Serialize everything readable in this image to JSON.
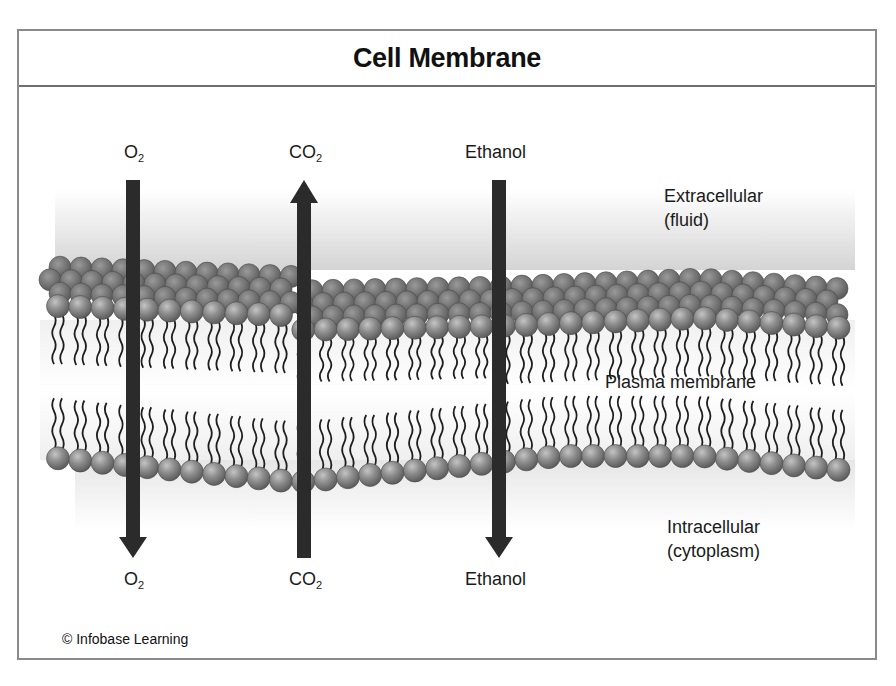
{
  "title": "Cell Membrane",
  "regions": {
    "extracellular": {
      "line1": "Extracellular",
      "line2": "(fluid)"
    },
    "membrane": {
      "label": "Plasma membrane"
    },
    "intracellular": {
      "line1": "Intracellular",
      "line2": "(cytoplasm)"
    }
  },
  "molecules": [
    {
      "id": "o2",
      "formula": "O",
      "subscript": "2",
      "direction": "down",
      "top_label_formula": "O",
      "top_label_sub": "2",
      "bottom_label_formula": "O",
      "bottom_label_sub": "2"
    },
    {
      "id": "co2",
      "formula": "CO",
      "subscript": "2",
      "direction": "up",
      "top_label_formula": "CO",
      "top_label_sub": "2",
      "bottom_label_formula": "CO",
      "bottom_label_sub": "2"
    },
    {
      "id": "ethanol",
      "formula": "Ethanol",
      "subscript": "",
      "direction": "down",
      "top_label_formula": "Ethanol",
      "top_label_sub": "",
      "bottom_label_formula": "Ethanol",
      "bottom_label_sub": ""
    }
  ],
  "credit": "© Infobase Learning",
  "colors": {
    "arrow": "#2b2b2b",
    "head_front": "#8c8c8c",
    "head_back": "#6e6e6e",
    "tail": "#1e1e1e",
    "frame": "#8a8a8a",
    "fluid_gradient": "#d9d9d9"
  }
}
